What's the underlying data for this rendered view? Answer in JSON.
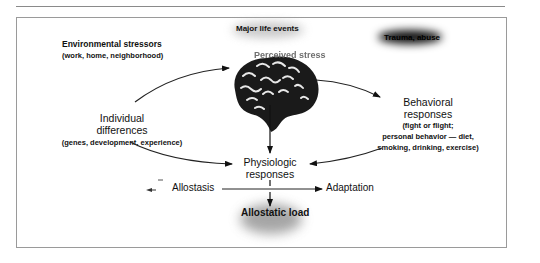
{
  "diagram": {
    "nodes": {
      "environmental": {
        "label": "Environmental stressors",
        "sub": "(work, home, neighborhood)"
      },
      "major_life_events": {
        "label": "Major life events"
      },
      "trauma": {
        "label": "Trauma, abuse"
      },
      "perceived_stress": {
        "label": "Perceived stress"
      },
      "individual": {
        "label_line1": "Individual",
        "label_line2": "differences",
        "sub": "(genes, development, experience)"
      },
      "behavioral": {
        "label_line1": "Behavioral",
        "label_line2": "responses",
        "sub_line1": "(fight or flight;",
        "sub_line2": "personal behavior — diet,",
        "sub_line3": "smoking, drinking, exercise)"
      },
      "physiologic": {
        "label_line1": "Physiologic",
        "label_line2": "responses"
      },
      "allostasis": {
        "label": "Allostasis"
      },
      "adaptation": {
        "label": "Adaptation"
      },
      "allostatic_load": {
        "label": "Allostatic load"
      }
    },
    "edges": [
      {
        "from": "individual",
        "to": "perceived_stress"
      },
      {
        "from": "perceived_stress",
        "to": "behavioral"
      },
      {
        "from": "perceived_stress",
        "to": "physiologic"
      },
      {
        "from": "individual",
        "to": "physiologic"
      },
      {
        "from": "behavioral",
        "to": "physiologic"
      },
      {
        "from": "allostasis",
        "to": "adaptation"
      },
      {
        "from": "physiologic",
        "to": "allostatic_load"
      }
    ],
    "icons": {
      "brain": "brain-illustration"
    }
  }
}
